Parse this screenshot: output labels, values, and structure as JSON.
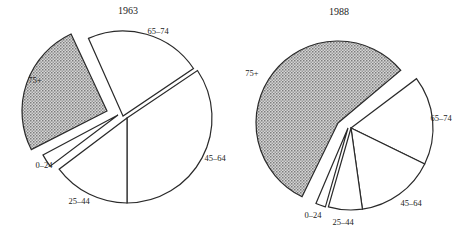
{
  "chart_data": [
    {
      "type": "pie",
      "title": "1963",
      "title_pos": [
        128,
        14
      ],
      "center": [
        127,
        118
      ],
      "radius": 85,
      "exploded": "75+",
      "categories": [
        "65–74",
        "45–64",
        "25–44",
        "0–24",
        "75+"
      ],
      "values": [
        22,
        34,
        15,
        3,
        26
      ],
      "unit": "percent (estimated)",
      "slices": [
        {
          "label": "65–74",
          "start": -114,
          "end": -34,
          "fill": "#ffffff",
          "label_pos": [
            158,
            34
          ],
          "offset": [
            -4,
            -2
          ]
        },
        {
          "label": "45–64",
          "start": -34,
          "end": 90,
          "fill": "#ffffff",
          "label_pos": [
            215,
            161
          ],
          "offset": [
            0,
            0
          ]
        },
        {
          "label": "25–44",
          "start": 90,
          "end": 143,
          "fill": "#ffffff",
          "label_pos": [
            79,
            204
          ],
          "offset": [
            0,
            0
          ]
        },
        {
          "label": "0–24",
          "start": 143,
          "end": 152,
          "fill": "#ffffff",
          "label_pos": [
            44,
            168
          ],
          "offset": [
            -9,
            -3
          ]
        },
        {
          "label": "75+",
          "start": 153,
          "end": 245,
          "fill": "pattern",
          "label_pos": [
            35,
            83
          ],
          "offset": [
            -20,
            -7
          ]
        }
      ]
    },
    {
      "type": "pie",
      "title": "1988",
      "title_pos": [
        339,
        15
      ],
      "center": [
        351,
        128
      ],
      "radius": 82,
      "exploded": "75+",
      "categories": [
        "65–74",
        "45–64",
        "25–44",
        "0–24",
        "75+"
      ],
      "values": [
        18,
        15,
        7,
        2,
        58
      ],
      "unit": "percent (estimated)",
      "slices": [
        {
          "label": "65–74",
          "start": -37,
          "end": 26,
          "fill": "#ffffff",
          "label_pos": [
            441,
            121
          ],
          "offset": [
            0,
            0
          ]
        },
        {
          "label": "45–64",
          "start": 26,
          "end": 82,
          "fill": "#ffffff",
          "label_pos": [
            411,
            206
          ],
          "offset": [
            0,
            0
          ]
        },
        {
          "label": "25–44",
          "start": 82,
          "end": 106,
          "fill": "#ffffff",
          "label_pos": [
            343,
            225
          ],
          "offset": [
            0,
            0
          ]
        },
        {
          "label": "0–24",
          "start": 106,
          "end": 113,
          "fill": "#ffffff",
          "label_pos": [
            313,
            218
          ],
          "offset": [
            -3,
            0
          ]
        },
        {
          "label": "75+",
          "start": 116,
          "end": 320,
          "fill": "pattern",
          "label_pos": [
            252,
            76
          ],
          "offset": [
            -13,
            -5
          ]
        }
      ]
    }
  ],
  "style": {
    "stroke": "#2a2a2a",
    "pattern_fg": "#8a8a8a",
    "pattern_bg": "#d8d8d8"
  }
}
